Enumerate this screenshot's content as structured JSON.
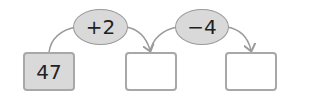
{
  "start_value": "47",
  "operations": [
    {
      "label": "+2"
    },
    {
      "label": "−4"
    }
  ],
  "boxes": [
    {
      "value": "47",
      "filled": true
    },
    {
      "value": "",
      "filled": false
    },
    {
      "value": "",
      "filled": false
    }
  ],
  "colors": {
    "filled_box": "#d9d9d9",
    "border": "#a8a8a8",
    "oval_fill": "#d9d9d9"
  }
}
